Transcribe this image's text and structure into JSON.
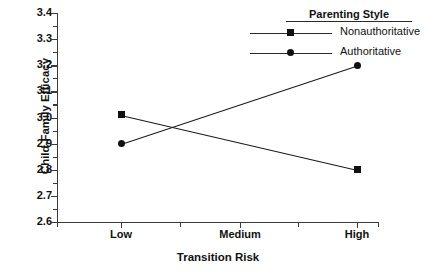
{
  "chart_data": {
    "type": "line",
    "title": "",
    "xlabel": "Transition Risk",
    "ylabel": "Child-Family Efficacy",
    "categories": [
      "Low",
      "Medium",
      "High"
    ],
    "plotted_categories": [
      "Low",
      "High"
    ],
    "xtick_labels": [
      "Low",
      "Medium",
      "High"
    ],
    "ytick_labels": [
      "2.6",
      "2.7",
      "2.8",
      "2.9",
      "3.0",
      "3.1",
      "3.2",
      "3.3",
      "3.4"
    ],
    "ylim": [
      2.6,
      3.4
    ],
    "ystep": 0.1,
    "yminor_ticks": true,
    "xminor_ticks": true,
    "grid": false,
    "legend_position": "top-right",
    "legend_title": "Parenting Style",
    "series": [
      {
        "name": "Nonauthoritative",
        "marker": "square",
        "x": [
          "Low",
          "High"
        ],
        "values": [
          3.01,
          2.8
        ]
      },
      {
        "name": "Authoritative",
        "marker": "circle",
        "x": [
          "Low",
          "High"
        ],
        "values": [
          2.9,
          3.2
        ]
      }
    ],
    "colors": {
      "line": "#1a1a1a",
      "marker": "#111111",
      "axis": "#3a3a3a",
      "background": "#ffffff",
      "text": "#111111"
    }
  },
  "legend": {
    "title": "Parenting Style",
    "entries": [
      {
        "label": "Nonauthoritative",
        "marker": "square-marker"
      },
      {
        "label": "Authoritative",
        "marker": "circle-marker"
      }
    ]
  },
  "axes": {
    "x_title": "Transition Risk",
    "y_title": "Child-Family Efficacy",
    "x_ticks": [
      "Low",
      "Medium",
      "High"
    ],
    "y_ticks": [
      "3.4",
      "3.3",
      "3.2",
      "3.1",
      "3.0",
      "2.9",
      "2.8",
      "2.7",
      "2.6"
    ]
  },
  "caption": ""
}
